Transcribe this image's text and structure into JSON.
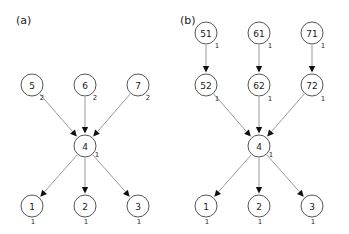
{
  "figure": {
    "width": 349,
    "height": 234,
    "background": "#ffffff",
    "edge_color": "#999999",
    "node_stroke_color": "#555555",
    "node_fill_color": "#ffffff",
    "arrowhead_color": "#111111",
    "text_color": "#1a1a1a"
  },
  "panels": [
    {
      "id": "panel-a",
      "label": "(a)",
      "label_x": 16,
      "label_y": 24,
      "node_radius": 11,
      "nodes": [
        {
          "id": "a-5",
          "label": "5",
          "sublabel": "2",
          "cx": 32,
          "cy": 85,
          "sub_dx": 10,
          "sub_dy": 13
        },
        {
          "id": "a-6",
          "label": "6",
          "sublabel": "2",
          "cx": 85,
          "cy": 85,
          "sub_dx": 10,
          "sub_dy": 13
        },
        {
          "id": "a-7",
          "label": "7",
          "sublabel": "2",
          "cx": 138,
          "cy": 85,
          "sub_dx": 10,
          "sub_dy": 13
        },
        {
          "id": "a-4",
          "label": "4",
          "sublabel": "1",
          "cx": 85,
          "cy": 146,
          "sub_dx": 12,
          "sub_dy": 9
        },
        {
          "id": "a-1",
          "label": "1",
          "sublabel": "1",
          "cx": 32,
          "cy": 206,
          "sub_dx": 1,
          "sub_dy": 16
        },
        {
          "id": "a-2",
          "label": "2",
          "sublabel": "1",
          "cx": 85,
          "cy": 206,
          "sub_dx": 1,
          "sub_dy": 16
        },
        {
          "id": "a-3",
          "label": "3",
          "sublabel": "1",
          "cx": 138,
          "cy": 206,
          "sub_dx": 1,
          "sub_dy": 16
        }
      ],
      "edges": [
        {
          "id": "a-e1",
          "from": "a-5",
          "to": "a-4"
        },
        {
          "id": "a-e2",
          "from": "a-6",
          "to": "a-4"
        },
        {
          "id": "a-e3",
          "from": "a-7",
          "to": "a-4"
        },
        {
          "id": "a-e4",
          "from": "a-4",
          "to": "a-1"
        },
        {
          "id": "a-e5",
          "from": "a-4",
          "to": "a-2"
        },
        {
          "id": "a-e6",
          "from": "a-4",
          "to": "a-3"
        }
      ]
    },
    {
      "id": "panel-b",
      "label": "(b)",
      "label_x": 180,
      "label_y": 24,
      "node_radius": 11,
      "nodes": [
        {
          "id": "b-51",
          "label": "51",
          "sublabel": "1",
          "cx": 206,
          "cy": 33,
          "sub_dx": 11,
          "sub_dy": 13
        },
        {
          "id": "b-61",
          "label": "61",
          "sublabel": "1",
          "cx": 259,
          "cy": 33,
          "sub_dx": 11,
          "sub_dy": 13
        },
        {
          "id": "b-71",
          "label": "71",
          "sublabel": "1",
          "cx": 312,
          "cy": 33,
          "sub_dx": 11,
          "sub_dy": 13
        },
        {
          "id": "b-52",
          "label": "52",
          "sublabel": "1",
          "cx": 206,
          "cy": 85,
          "sub_dx": 11,
          "sub_dy": 14
        },
        {
          "id": "b-62",
          "label": "62",
          "sublabel": "1",
          "cx": 259,
          "cy": 85,
          "sub_dx": 11,
          "sub_dy": 14
        },
        {
          "id": "b-72",
          "label": "72",
          "sublabel": "1",
          "cx": 312,
          "cy": 85,
          "sub_dx": 11,
          "sub_dy": 14
        },
        {
          "id": "b-4",
          "label": "4",
          "sublabel": "1",
          "cx": 259,
          "cy": 146,
          "sub_dx": 12,
          "sub_dy": 9
        },
        {
          "id": "b-1",
          "label": "1",
          "sublabel": "1",
          "cx": 206,
          "cy": 206,
          "sub_dx": 1,
          "sub_dy": 16
        },
        {
          "id": "b-2",
          "label": "2",
          "sublabel": "1",
          "cx": 259,
          "cy": 206,
          "sub_dx": 1,
          "sub_dy": 16
        },
        {
          "id": "b-3",
          "label": "3",
          "sublabel": "1",
          "cx": 312,
          "cy": 206,
          "sub_dx": 1,
          "sub_dy": 16
        }
      ],
      "edges": [
        {
          "id": "b-e1",
          "from": "b-51",
          "to": "b-52"
        },
        {
          "id": "b-e2",
          "from": "b-61",
          "to": "b-62"
        },
        {
          "id": "b-e3",
          "from": "b-71",
          "to": "b-72"
        },
        {
          "id": "b-e4",
          "from": "b-52",
          "to": "b-4"
        },
        {
          "id": "b-e5",
          "from": "b-62",
          "to": "b-4"
        },
        {
          "id": "b-e6",
          "from": "b-72",
          "to": "b-4"
        },
        {
          "id": "b-e7",
          "from": "b-4",
          "to": "b-1"
        },
        {
          "id": "b-e8",
          "from": "b-4",
          "to": "b-2"
        },
        {
          "id": "b-e9",
          "from": "b-4",
          "to": "b-3"
        }
      ]
    }
  ]
}
